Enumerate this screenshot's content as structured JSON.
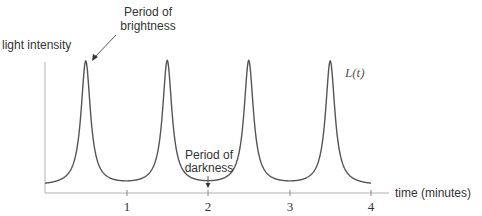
{
  "chart_data": {
    "type": "line",
    "title": "",
    "xlabel": "time (minutes)",
    "ylabel": "light intensity",
    "xlim": [
      0,
      4
    ],
    "x_ticks": [
      1,
      2,
      3,
      4
    ],
    "grid": false,
    "series": [
      {
        "name": "L(t)",
        "description": "Periodic sharp peaks at t = 0.5, 1.5, 2.5, 3.5 minutes; low flat troughs at t = 0, 1, 2, 3, 4",
        "peaks_x": [
          0.5,
          1.5,
          2.5,
          3.5
        ],
        "troughs_x": [
          0,
          1,
          2,
          3,
          4
        ],
        "period": 1
      }
    ],
    "annotations": [
      {
        "text": "Period of brightness",
        "points_to": "peak at t=0.5"
      },
      {
        "text": "Period of darkness",
        "points_to": "trough at t=2"
      }
    ],
    "curve_label": "L(t)"
  },
  "labels": {
    "ylabel": "light intensity",
    "xlabel": "time (minutes)",
    "bright1": "Period of",
    "bright2": "brightness",
    "dark1": "Period of",
    "dark2": "darkness",
    "curve": "L(t)",
    "ticks": [
      "1",
      "2",
      "3",
      "4"
    ]
  }
}
